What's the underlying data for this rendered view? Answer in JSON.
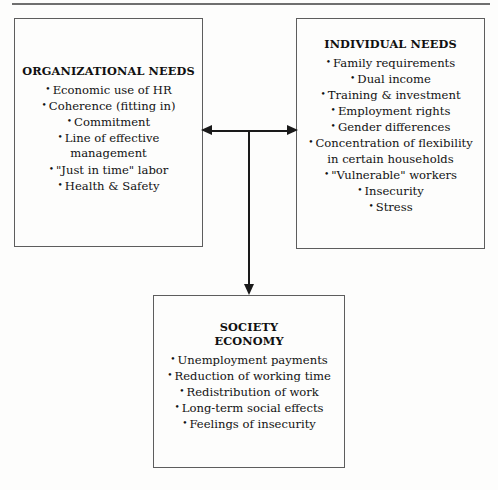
{
  "diagram": {
    "top_rule": true,
    "accent_color": "#1a1a1a",
    "border_color": "#5d5d5d",
    "background_color": "#fdfdfc"
  },
  "boxes": {
    "organizational": {
      "title": "ORGANIZATIONAL NEEDS",
      "items": [
        "Economic use of HR",
        "Coherence (fitting in)",
        "Commitment",
        "Line of effective management",
        "\"Just in time\" labor",
        "Health & Safety"
      ]
    },
    "individual": {
      "title": "INDIVIDUAL NEEDS",
      "items": [
        "Family requirements",
        "Dual income",
        "Training & investment",
        "Employment rights",
        "Gender differences",
        "Concentration of flexibility",
        "in certain households",
        "\"Vulnerable\" workers",
        "Insecurity",
        "Stress"
      ]
    },
    "society": {
      "title_line1": "SOCIETY",
      "title_line2": "ECONOMY",
      "items": [
        "Unemployment payments",
        "Reduction of working time",
        "Redistribution of work",
        "Long-term social effects",
        "Feelings of insecurity"
      ]
    }
  },
  "connectors": {
    "horizontal": {
      "name": "bidirectional-arrow",
      "from": "organizational",
      "to": "individual",
      "style": "double-headed"
    },
    "vertical": {
      "name": "downward-arrow",
      "to": "society",
      "style": "single-headed"
    }
  },
  "symbols": {
    "bullet": "•"
  }
}
